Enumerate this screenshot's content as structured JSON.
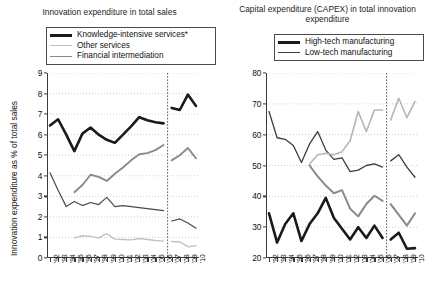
{
  "figure": {
    "width": 437,
    "height": 295,
    "background": "#ffffff"
  },
  "panels": [
    {
      "id": "left",
      "title": "Innovation expenditure in total sales",
      "ylabel": "Innovation expenditure as % of total sales",
      "legend": [
        {
          "label": "Knowledge-intensive services*",
          "color": "#1a1a1a",
          "width": 2.6
        },
        {
          "label": "Other services",
          "color": "#c2c2c2",
          "width": 1.1
        },
        {
          "label": "Financial intermediation",
          "color": "#8a8a8a",
          "width": 1.3
        }
      ]
    },
    {
      "id": "right",
      "title": "Capital expenditure (CAPEX) in total innovation expenditure",
      "ylabel": "Capex as % of total innovation expenditure",
      "legend": [
        {
          "label": "High-tech manufacturing",
          "color": "#1a1a1a",
          "width": 2.6
        },
        {
          "label": "Low-tech manufacturing",
          "color": "#3d3d3d",
          "width": 1.1
        }
      ]
    }
  ],
  "chart_data": [
    {
      "type": "line",
      "panel": "left",
      "title": "Innovation expenditure in total sales",
      "xlabel": "",
      "ylabel": "Innovation expenditure as % of total sales",
      "ylim": [
        0,
        9
      ],
      "yticks": [
        0,
        1,
        2,
        3,
        4,
        5,
        6,
        7,
        8,
        9
      ],
      "grid": "horizontal-dotted",
      "legend_position": "above-plot",
      "annotations": [
        {
          "type": "vertical-dashed-line",
          "x": "'06/'07 break",
          "note": "series break between 2006 and 2007"
        }
      ],
      "footnote": "* asterisk on Knowledge-intensive services",
      "categories": [
        "'92",
        "'93",
        "'94",
        "'95",
        "'96",
        "'97",
        "'98",
        "'99",
        "'00",
        "'01",
        "'02",
        "'03",
        "'04",
        "'05",
        "'06",
        "'07",
        "'08",
        "'09",
        "'10"
      ],
      "series": [
        {
          "name": "Knowledge-intensive services*",
          "color": "#1a1a1a",
          "width": 2.6,
          "break_after_index": 14,
          "values": [
            6.45,
            6.75,
            6.0,
            5.2,
            6.05,
            6.35,
            6.0,
            5.75,
            5.6,
            6.0,
            6.4,
            6.85,
            6.7,
            6.6,
            6.55,
            7.3,
            7.2,
            7.95,
            7.4
          ]
        },
        {
          "name": "Financial intermediation",
          "color": "#8a8a8a",
          "width": 1.9,
          "break_after_index": 14,
          "start_index": 3,
          "values": [
            null,
            null,
            null,
            3.2,
            3.55,
            4.05,
            3.95,
            3.75,
            4.1,
            4.4,
            4.75,
            5.05,
            5.1,
            5.25,
            5.5,
            4.75,
            5.0,
            5.35,
            4.85,
            5.0
          ]
        },
        {
          "name": "Other services",
          "color": "#4a4a4a",
          "width": 1.2,
          "break_after_index": 14,
          "values": [
            4.15,
            3.3,
            2.5,
            2.75,
            2.55,
            2.7,
            2.6,
            2.95,
            2.5,
            2.55,
            2.5,
            2.45,
            2.4,
            2.35,
            2.3,
            1.8,
            1.9,
            1.7,
            1.45
          ]
        },
        {
          "name": "Other services (light)",
          "color": "#c2c2c2",
          "width": 1.4,
          "break_after_index": 14,
          "start_index": 3,
          "values": [
            null,
            null,
            null,
            0.98,
            1.08,
            1.05,
            0.98,
            1.18,
            0.92,
            0.9,
            0.88,
            0.95,
            0.9,
            0.85,
            0.82,
            0.8,
            0.78,
            0.55,
            0.6
          ]
        }
      ]
    },
    {
      "type": "line",
      "panel": "right",
      "title": "Capital expenditure (CAPEX) in total innovation expenditure",
      "xlabel": "",
      "ylabel": "Capex as % of total innovation expenditure",
      "ylim": [
        20,
        80
      ],
      "yticks": [
        20,
        30,
        40,
        50,
        60,
        70,
        80
      ],
      "grid": "horizontal-dotted",
      "legend_position": "above-plot",
      "annotations": [
        {
          "type": "vertical-dashed-line",
          "x": "'06/'07 break",
          "note": "series break between 2006 and 2007"
        }
      ],
      "categories": [
        "'92",
        "'93",
        "'94",
        "'95",
        "'96",
        "'97",
        "'98",
        "'99",
        "'00",
        "'01",
        "'02",
        "'03",
        "'04",
        "'05",
        "'06",
        "'07",
        "'08",
        "'09",
        "'10"
      ],
      "series": [
        {
          "name": "High-tech manufacturing",
          "color": "#1a1a1a",
          "width": 2.6,
          "break_after_index": 14,
          "values": [
            34.5,
            25.0,
            31.0,
            34.5,
            25.5,
            31.0,
            34.5,
            39.5,
            33.0,
            29.5,
            26.0,
            30.0,
            26.5,
            30.5,
            26.5,
            26.0,
            28.2,
            23.0,
            23.2
          ]
        },
        {
          "name": "Low-tech manufacturing",
          "color": "#3d3d3d",
          "width": 1.3,
          "break_after_index": 14,
          "values": [
            67.5,
            59.0,
            58.5,
            56.5,
            51.0,
            57.0,
            61.0,
            55.0,
            52.0,
            52.5,
            48.0,
            48.5,
            50.0,
            50.5,
            49.5,
            51.5,
            53.5,
            49.5,
            46.2
          ]
        },
        {
          "name": "Mid series (grey)",
          "color": "#8a8a8a",
          "width": 2.0,
          "break_after_index": 14,
          "start_index": 5,
          "values": [
            null,
            null,
            null,
            null,
            null,
            50.0,
            46.5,
            43.5,
            41.0,
            42.0,
            36.0,
            33.5,
            37.5,
            40.2,
            38.5,
            37.5,
            34.0,
            30.5,
            34.5
          ]
        },
        {
          "name": "Upper series (light grey)",
          "color": "#b5b5b5",
          "width": 1.6,
          "break_after_index": 14,
          "start_index": 5,
          "values": [
            null,
            null,
            null,
            null,
            null,
            50.5,
            53.5,
            54.0,
            53.5,
            54.5,
            58.0,
            67.5,
            61.0,
            68.0,
            68.0,
            64.8,
            71.8,
            65.5,
            70.8
          ]
        }
      ]
    }
  ]
}
